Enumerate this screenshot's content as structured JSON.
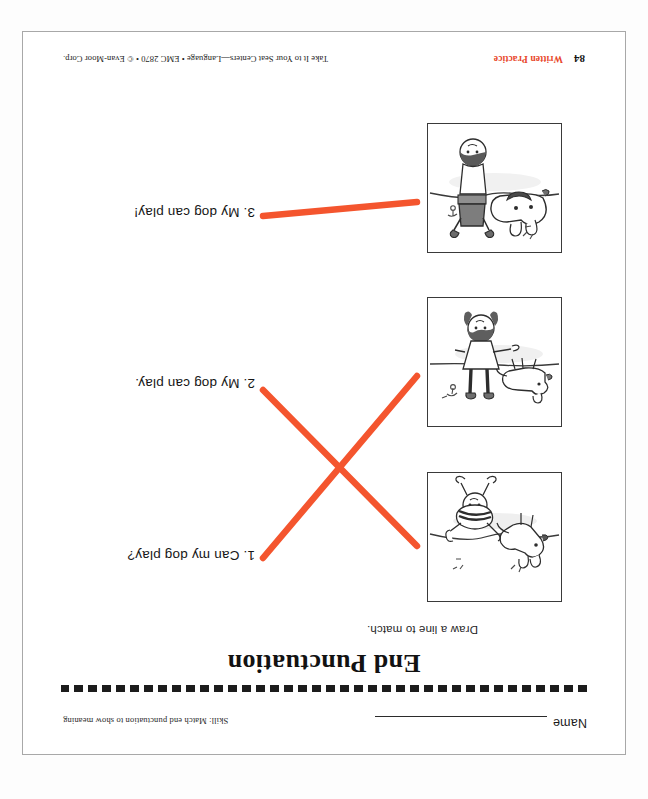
{
  "page": {
    "title": "End Punctuation",
    "directions": "Draw a line to match.",
    "name_label": "Name",
    "name_value": "",
    "skill_note": "Skill: Match end punctuation to show meaning",
    "page_number": "84",
    "section_tag": "Written Practice",
    "credit": "Take It to Your Seat Centers—Language • EMC 2870 • © Evan-Moor Corp.",
    "orientation": "upside-down",
    "accent_color": "#f4552e",
    "tag_color": "#e8462a",
    "rule_color": "#1c1c1c"
  },
  "pictures": [
    {
      "id": "picture-1",
      "caption": "Child rolling on the ground playing with a jumping dog",
      "position": "top"
    },
    {
      "id": "picture-2",
      "caption": "Girl standing still while a dog runs past her",
      "position": "middle"
    },
    {
      "id": "picture-3",
      "caption": "Child standing with arms up beside a barking dog",
      "position": "bottom"
    }
  ],
  "sentences": [
    {
      "id": "sentence-1",
      "number": "1.",
      "text": "1. Can my dog play?"
    },
    {
      "id": "sentence-2",
      "number": "2.",
      "text": "2. My dog can play."
    },
    {
      "id": "sentence-3",
      "number": "3.",
      "text": "3. My dog can play!"
    }
  ],
  "matches": [
    {
      "from": "picture-3",
      "to": "sentence-1",
      "color": "#f4552e"
    },
    {
      "from": "picture-1",
      "to": "sentence-2",
      "color": "#f4552e"
    },
    {
      "from": "picture-2",
      "to": "sentence-3",
      "color": "#f4552e"
    }
  ]
}
